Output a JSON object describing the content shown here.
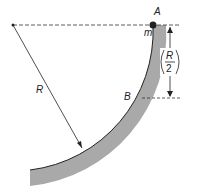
{
  "labels": {
    "A": "A",
    "m": "m",
    "R": "R",
    "B": "B",
    "frac_num": "R",
    "frac_den": "2"
  },
  "colors": {
    "track": "#a9a9a9",
    "line": "#222222"
  }
}
